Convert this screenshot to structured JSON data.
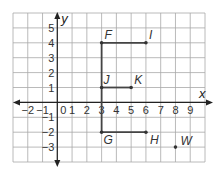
{
  "chart_data": {
    "type": "scatter",
    "title": "",
    "xlabel": "x",
    "ylabel": "y",
    "xlim": [
      -3,
      10
    ],
    "ylim": [
      -4,
      6
    ],
    "grid": true,
    "x_ticks": [
      "-2",
      "-1",
      "0",
      "1",
      "2",
      "3",
      "4",
      "5",
      "6",
      "7",
      "8",
      "9"
    ],
    "y_ticks": [
      "5",
      "4",
      "3",
      "2",
      "1",
      "-1",
      "-2",
      "-3"
    ],
    "points": [
      {
        "label": "F",
        "x": 3,
        "y": 4
      },
      {
        "label": "I",
        "x": 6,
        "y": 4
      },
      {
        "label": "J",
        "x": 3,
        "y": 1
      },
      {
        "label": "K",
        "x": 5,
        "y": 1
      },
      {
        "label": "G",
        "x": 3,
        "y": -2
      },
      {
        "label": "H",
        "x": 6,
        "y": -2
      },
      {
        "label": "W",
        "x": 8,
        "y": -3
      }
    ],
    "segments": [
      {
        "from": "F",
        "to": "I"
      },
      {
        "from": "F",
        "to": "G"
      },
      {
        "from": "J",
        "to": "K"
      },
      {
        "from": "G",
        "to": "H"
      }
    ]
  },
  "axes": {
    "x_label": "x",
    "y_label": "y",
    "origin_label": "0"
  },
  "labels": {
    "F": "F",
    "I": "I",
    "J": "J",
    "K": "K",
    "G": "G",
    "H": "H",
    "W": "W"
  },
  "colors": {
    "grid": "#a8a8a8",
    "axis": "#222222",
    "segment": "#444444",
    "point": "#333333"
  }
}
